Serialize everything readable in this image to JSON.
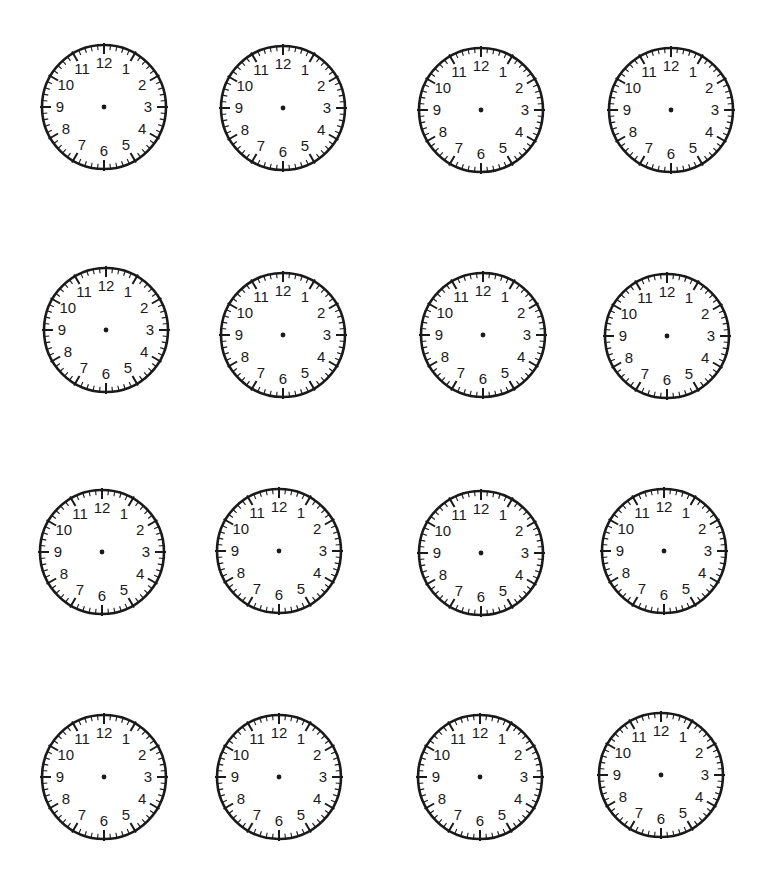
{
  "worksheet": {
    "title": "Blank clock faces worksheet",
    "ink_color": "#1a1a1a",
    "background_color": "#ffffff",
    "clock_radius": 62,
    "numerals": [
      "12",
      "1",
      "2",
      "3",
      "4",
      "5",
      "6",
      "7",
      "8",
      "9",
      "10",
      "11"
    ],
    "tick_marks": {
      "minute_ticks": 60,
      "hour_ticks": 12
    },
    "clocks": [
      {
        "row": 1,
        "col": 1,
        "cx": 104,
        "cy": 107
      },
      {
        "row": 1,
        "col": 2,
        "cx": 283,
        "cy": 108
      },
      {
        "row": 1,
        "col": 3,
        "cx": 481,
        "cy": 110
      },
      {
        "row": 1,
        "col": 4,
        "cx": 671,
        "cy": 110
      },
      {
        "row": 2,
        "col": 1,
        "cx": 106,
        "cy": 330
      },
      {
        "row": 2,
        "col": 2,
        "cx": 283,
        "cy": 335
      },
      {
        "row": 2,
        "col": 3,
        "cx": 483,
        "cy": 335
      },
      {
        "row": 2,
        "col": 4,
        "cx": 667,
        "cy": 336
      },
      {
        "row": 3,
        "col": 1,
        "cx": 102,
        "cy": 552
      },
      {
        "row": 3,
        "col": 2,
        "cx": 279,
        "cy": 551
      },
      {
        "row": 3,
        "col": 3,
        "cx": 481,
        "cy": 553
      },
      {
        "row": 3,
        "col": 4,
        "cx": 664,
        "cy": 551
      },
      {
        "row": 4,
        "col": 1,
        "cx": 104,
        "cy": 777
      },
      {
        "row": 4,
        "col": 2,
        "cx": 279,
        "cy": 777
      },
      {
        "row": 4,
        "col": 3,
        "cx": 480,
        "cy": 777
      },
      {
        "row": 4,
        "col": 4,
        "cx": 661,
        "cy": 775
      }
    ]
  }
}
